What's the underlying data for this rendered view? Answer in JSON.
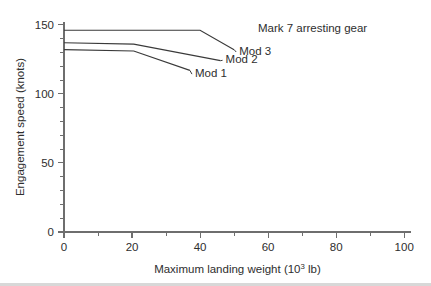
{
  "figure": {
    "background_color": "#ffffff",
    "line_color": "#3a3a3a",
    "axis_color": "#6e6e6e",
    "text_color": "#2e2e2e"
  },
  "chart_data": {
    "type": "line",
    "title": "",
    "xlabel_text": "Maximum landing weight (10",
    "xlabel_sup": "3",
    "xlabel_tail": " lb)",
    "xlabel": "Maximum landing weight (10^3 lb)",
    "ylabel": "Engagement speed (knots)",
    "xlim": [
      0,
      102
    ],
    "ylim": [
      0,
      152
    ],
    "xticks": [
      0,
      20,
      40,
      60,
      80,
      100
    ],
    "xtick_labels": [
      "0",
      "20",
      "40",
      "60",
      "80",
      "100"
    ],
    "xminor_step": 10,
    "yticks": [
      0,
      50,
      100,
      150
    ],
    "ytick_labels": [
      "0",
      "50",
      "100",
      "150"
    ],
    "yminor_step": 10,
    "grid": false,
    "legend_position": "inline-annotations",
    "annotations": [
      {
        "name": "mark-7-arresting-gear",
        "text": "Mark 7 arresting gear",
        "x": 57,
        "y": 148
      }
    ],
    "series": [
      {
        "name": "Mod 3",
        "label": "Mod 3",
        "label_x": 51.5,
        "label_y": 131,
        "x": [
          0,
          40,
          50
        ],
        "values": [
          146,
          146,
          132
        ]
      },
      {
        "name": "Mod 2",
        "label": "Mod 2",
        "label_x": 47.5,
        "label_y": 125,
        "x": [
          0,
          20.5,
          46
        ],
        "values": [
          137,
          136,
          124
        ]
      },
      {
        "name": "Mod 1",
        "label": "Mod 1",
        "label_x": 38.5,
        "label_y": 115,
        "x": [
          0,
          20.5,
          37
        ],
        "values": [
          132,
          131,
          117
        ]
      }
    ]
  }
}
